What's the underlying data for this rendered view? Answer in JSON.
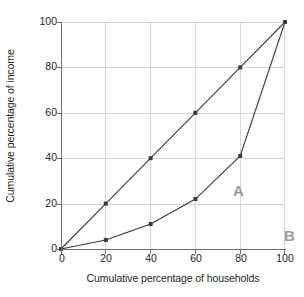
{
  "chart_data": {
    "type": "line",
    "title": "",
    "xlabel": "Cumulative percentage of households",
    "ylabel": "Cumulative percentage of income",
    "xlim": [
      0,
      100
    ],
    "ylim": [
      0,
      100
    ],
    "xticks": [
      0,
      20,
      40,
      60,
      80,
      100
    ],
    "yticks": [
      0,
      20,
      40,
      60,
      80,
      100
    ],
    "xtick_labels": [
      "0",
      "20",
      "40",
      "60",
      "80",
      "100"
    ],
    "ytick_labels": [
      "0",
      "20",
      "40",
      "60",
      "80",
      "100"
    ],
    "grid": true,
    "legend": "none",
    "series": [
      {
        "name": "Line of equality",
        "x": [
          0,
          20,
          40,
          60,
          80,
          100
        ],
        "values": [
          0,
          20,
          40,
          60,
          80,
          100
        ],
        "color": "#3a3a3a",
        "marker": "square"
      },
      {
        "name": "Lorenz curve",
        "x": [
          0,
          20,
          40,
          60,
          80,
          100
        ],
        "values": [
          0,
          4,
          11,
          22,
          41,
          100
        ],
        "color": "#3a3a3a",
        "marker": "square"
      }
    ],
    "annotations": [
      {
        "text": "A",
        "x": 58,
        "y": 31,
        "color": "#9b9b9b"
      },
      {
        "text": "B",
        "x": 80,
        "y": 11,
        "color": "#9b9b9b"
      }
    ]
  },
  "axis": {
    "x_title": "Cumulative percentage of households",
    "y_title": "Cumulative percentage of income",
    "x_tick_labels": [
      "0",
      "20",
      "40",
      "60",
      "80",
      "100"
    ],
    "y_tick_labels": [
      "0",
      "20",
      "40",
      "60",
      "80",
      "100"
    ]
  },
  "labels": {
    "region_a": "A",
    "region_b": "B"
  },
  "colors": {
    "line": "#3a3a3a",
    "grid": "#d6d6d6",
    "axis": "#6f6f6f",
    "region_label": "#9b9b9b",
    "text": "#231f20",
    "background": "#ffffff"
  }
}
